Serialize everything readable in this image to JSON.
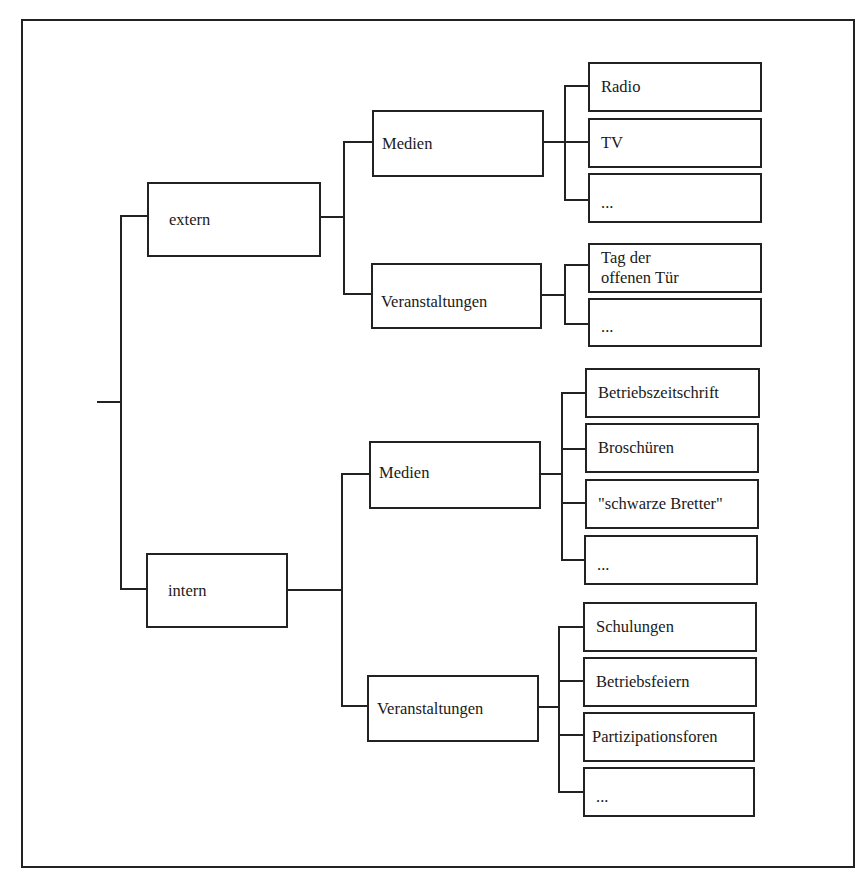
{
  "diagram": {
    "type": "tree",
    "orientation": "left-to-right",
    "root": {
      "children": [
        {
          "label": "extern",
          "children": [
            {
              "label": "Medien",
              "children": [
                "Radio",
                "TV",
                "..."
              ]
            },
            {
              "label": "Veranstaltungen",
              "children": [
                "Tag der\noffenen Tür",
                "..."
              ]
            }
          ]
        },
        {
          "label": "intern",
          "children": [
            {
              "label": "Medien",
              "children": [
                "Betriebszeitschrift",
                "Broschüren",
                "\"schwarze Bretter\"",
                "..."
              ]
            },
            {
              "label": "Veranstaltungen",
              "children": [
                "Schulungen",
                "Betriebsfeiern",
                "Partizipationsforen",
                "..."
              ]
            }
          ]
        }
      ]
    }
  },
  "colors": {
    "line": "#222222",
    "background": "#ffffff",
    "text": "#1a1a1a"
  }
}
